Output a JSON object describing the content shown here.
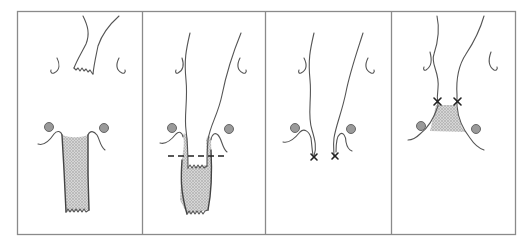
{
  "figure": {
    "type": "four-panel anatomical procedure diagram",
    "panel_count": 4,
    "colors": {
      "frame": "#8a8a8a",
      "line": "#555555",
      "shading": "#bdbdbd",
      "ovary_dot": "#9a9a9a",
      "marker": "#222222"
    },
    "panels": [
      {
        "index": 1,
        "elements": [
          "upper-segment-with-cut-edge",
          "lower-shaded-segment-with-cut-edge",
          "left-ovary",
          "right-ovary",
          "left-tube",
          "right-tube",
          "left-hook",
          "right-hook"
        ]
      },
      {
        "index": 2,
        "elements": [
          "upper-tube-inserted-into-lower-segment",
          "shaded-lower-segment",
          "dashed-section-line",
          "left-ovary",
          "right-ovary"
        ]
      },
      {
        "index": 3,
        "elements": [
          "two-separated-limbs",
          "left-x-marker",
          "right-x-marker",
          "left-ovary",
          "right-ovary"
        ]
      },
      {
        "index": 4,
        "elements": [
          "joined-limbs",
          "shaded-anastomosis",
          "left-x-marker",
          "right-x-marker",
          "left-ovary",
          "right-ovary"
        ]
      }
    ]
  }
}
